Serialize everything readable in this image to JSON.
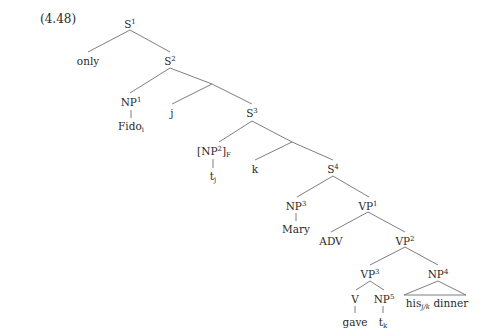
{
  "example_number": "(4.48)",
  "nodes": {
    "S1": {
      "label": "S",
      "sup": "1"
    },
    "only": {
      "label": "only"
    },
    "S2": {
      "label": "S",
      "sup": "2"
    },
    "NP1": {
      "label": "NP",
      "sup": "1"
    },
    "Fido": {
      "label": "Fido",
      "sub": "i"
    },
    "j": {
      "label": "j"
    },
    "S3": {
      "label": "S",
      "sup": "3"
    },
    "NP2F": {
      "pre": "[NP",
      "sup": "2",
      "post": "]",
      "sub": "F"
    },
    "tj": {
      "label": "t",
      "sub": "j"
    },
    "k": {
      "label": "k"
    },
    "S4": {
      "label": "S",
      "sup": "4"
    },
    "NP3": {
      "label": "NP",
      "sup": "3"
    },
    "Mary": {
      "label": "Mary"
    },
    "VP1": {
      "label": "VP",
      "sup": "1"
    },
    "ADV": {
      "label": "ADV"
    },
    "VP2": {
      "label": "VP",
      "sup": "2"
    },
    "VP3": {
      "label": "VP",
      "sup": "3"
    },
    "NP4": {
      "label": "NP",
      "sup": "4"
    },
    "V": {
      "label": "V"
    },
    "NP5": {
      "label": "NP",
      "sup": "5"
    },
    "gave": {
      "label": "gave"
    },
    "tk": {
      "label": "t",
      "sub": "k"
    },
    "his": {
      "label": "his",
      "sub": "j/k",
      "post": " dinner"
    }
  }
}
